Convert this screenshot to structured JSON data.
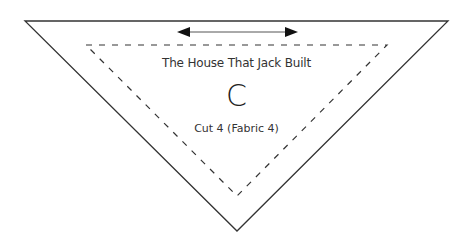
{
  "pattern_piece": {
    "title": "The House That Jack Built",
    "letter": "C",
    "cut_instruction": "Cut 4 (Fabric 4)",
    "grain_arrow": "horizontal-double-arrow",
    "colors": {
      "outline": "#333333",
      "seam_line": "#333333",
      "text": "#333333",
      "background": "#ffffff"
    }
  }
}
